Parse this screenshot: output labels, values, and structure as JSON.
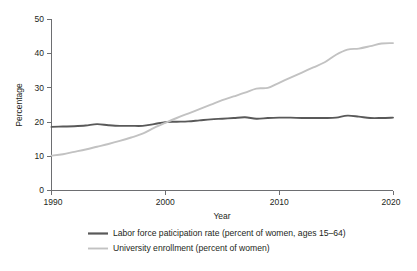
{
  "chart_data": {
    "type": "line",
    "title": "",
    "xlabel": "Year",
    "ylabel": "Percentage",
    "xlim": [
      1990,
      2020
    ],
    "ylim": [
      0,
      50
    ],
    "xticks": [
      1990,
      2000,
      2010,
      2020
    ],
    "yticks": [
      0,
      10,
      20,
      30,
      40,
      50
    ],
    "grid": false,
    "legend_position": "bottom",
    "x": [
      1990,
      1991,
      1992,
      1993,
      1994,
      1995,
      1996,
      1997,
      1998,
      1999,
      2000,
      2001,
      2002,
      2003,
      2004,
      2005,
      2006,
      2007,
      2008,
      2009,
      2010,
      2011,
      2012,
      2013,
      2014,
      2015,
      2016,
      2017,
      2018,
      2019,
      2020
    ],
    "series": [
      {
        "name": "Labor force paticipation rate (percent of women, ages 15–64)",
        "color": "#595959",
        "width": 1.9,
        "values": [
          18.6,
          18.7,
          18.8,
          19.0,
          19.4,
          19.1,
          18.9,
          18.9,
          18.9,
          19.4,
          20.0,
          20.1,
          20.2,
          20.5,
          20.8,
          21.0,
          21.2,
          21.4,
          21.0,
          21.2,
          21.3,
          21.3,
          21.2,
          21.2,
          21.2,
          21.3,
          21.9,
          21.6,
          21.2,
          21.2,
          21.3
        ]
      },
      {
        "name": "University enrollment (percent of women)",
        "color": "#c2c2c2",
        "width": 1.9,
        "values": [
          10.2,
          10.6,
          11.3,
          12.0,
          12.8,
          13.6,
          14.5,
          15.5,
          16.6,
          18.3,
          19.8,
          21.2,
          22.5,
          23.8,
          25.1,
          26.4,
          27.5,
          28.6,
          29.8,
          30.0,
          31.5,
          33.0,
          34.5,
          36.0,
          37.5,
          39.7,
          41.2,
          41.5,
          42.2,
          43.0,
          43.1
        ]
      }
    ],
    "legend": [
      {
        "label": "Labor force paticipation rate (percent of women, ages 15–64)",
        "color": "#595959"
      },
      {
        "label": "University enrollment (percent of women)",
        "color": "#c2c2c2"
      }
    ]
  }
}
